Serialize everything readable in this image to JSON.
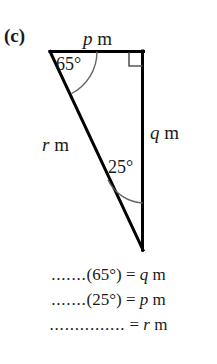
{
  "part": {
    "label": "(c)"
  },
  "diagram": {
    "type": "right-triangle",
    "vertices": {
      "top_left": [
        50,
        51
      ],
      "top_right": [
        143,
        52
      ],
      "bottom": [
        143,
        250
      ]
    },
    "right_angle_at": "top_right",
    "stroke_color": "#000000",
    "arc_color": "#555555",
    "background_color": "#ffffff"
  },
  "side_labels": {
    "top": {
      "variable": "p",
      "unit": "m",
      "text": "p m"
    },
    "right": {
      "variable": "q",
      "unit": "m",
      "text": "q m"
    },
    "hypotenuse": {
      "variable": "r",
      "unit": "m",
      "text": "r m"
    }
  },
  "angle_labels": {
    "at_top_left": "65°",
    "at_bottom_interior": "25°"
  },
  "answers": {
    "lines": [
      {
        "dots": ".......",
        "expr": "(65°) = ",
        "variable": "q",
        "unit": " m"
      },
      {
        "dots": ".......",
        "expr": "(25°) = ",
        "variable": "p",
        "unit": " m"
      },
      {
        "dots": "...............",
        "expr": "= ",
        "variable": "r",
        "unit": " m"
      }
    ],
    "line1_full": ".......(65°) = q m",
    "line2_full": ".......(25°) = p m",
    "line3_full": "............... = r m"
  }
}
